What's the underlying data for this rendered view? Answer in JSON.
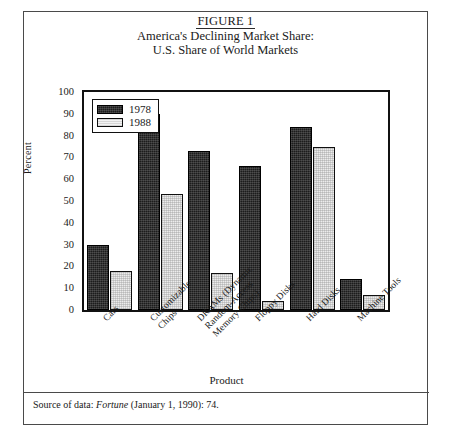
{
  "figure": {
    "label": "FIGURE 1",
    "title_line_1": "America's Declining Market Share:",
    "title_line_2": "U.S. Share of World Markets"
  },
  "source": {
    "prefix": "Source of data: ",
    "journal": "Fortune",
    "citation": " (January 1, 1990): 74."
  },
  "chart_data": {
    "type": "bar",
    "title": "America's Declining Market Share: U.S. Share of World Markets",
    "xlabel": "Product",
    "ylabel": "Percent",
    "ylim": [
      0,
      100
    ],
    "yticks": [
      0,
      10,
      20,
      30,
      40,
      50,
      60,
      70,
      80,
      90,
      100
    ],
    "ytick_labels": [
      "0",
      "10",
      "20",
      "30",
      "40",
      "50",
      "60",
      "70",
      "80",
      "90",
      "100"
    ],
    "grid": false,
    "legend_position": "top-left",
    "categories": [
      "Cars",
      "Customizable\nChips",
      "DRAMs (Dynamic\nRandom-Access\nMemory Chips)",
      "Floppy Disks",
      "Hard Disks",
      "Machine Tools"
    ],
    "category_labels_flat": [
      "Cars",
      "Customizable Chips",
      "DRAMs (Dynamic Random-Access Memory Chips)",
      "Floppy Disks",
      "Hard Disks",
      "Machine Tools"
    ],
    "series": [
      {
        "name": "1978",
        "color": "#1c1c1c",
        "values": [
          30,
          90,
          73,
          66,
          84,
          14
        ]
      },
      {
        "name": "1988",
        "color": "#ececec",
        "values": [
          18,
          53,
          17,
          4,
          75,
          7
        ]
      }
    ]
  }
}
